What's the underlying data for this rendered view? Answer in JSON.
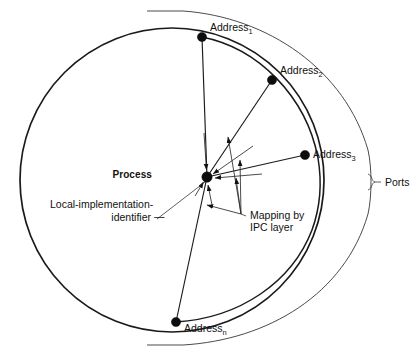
{
  "figure": {
    "background": "#ffffff",
    "ink": "#1a1a1a"
  },
  "labels": {
    "process": "Process",
    "address_base": "Address",
    "address_1_sub": "1",
    "address_2_sub": "2",
    "address_3_sub": "3",
    "address_n_sub": "n",
    "ports": "Ports",
    "local_id_line1": "Local-implementation-",
    "local_id_line2": "identifier",
    "local_id_dash": "—",
    "mapping_line1": "Mapping by",
    "mapping_line2": "IPC layer"
  },
  "nodes": [
    {
      "name": "process",
      "label": "Process",
      "x": 207,
      "y": 177,
      "r": 5.2
    },
    {
      "name": "address-1",
      "label": "Address",
      "subscript": "1",
      "x": 202,
      "y": 37,
      "r": 4.6
    },
    {
      "name": "address-2",
      "label": "Address",
      "subscript": "2",
      "x": 272,
      "y": 80,
      "r": 4.6
    },
    {
      "name": "address-3",
      "label": "Address",
      "subscript": "3",
      "x": 305,
      "y": 155,
      "r": 4.6
    },
    {
      "name": "address-n",
      "label": "Address",
      "subscript": "n",
      "x": 176,
      "y": 322,
      "r": 4.6
    }
  ],
  "geometry": {
    "main_circle": {
      "cx": 172,
      "cy": 180,
      "r": 152
    },
    "inner_arc_note": "second circle offset to the right passing through the address nodes",
    "ports_arc_note": "outer open brace arc labelled Ports"
  },
  "annotations": [
    {
      "name": "local-implementation-identifier",
      "text": "Local-implementation-identifier",
      "leader_from": {
        "x": 186,
        "y": 213
      },
      "leader_to": {
        "x": 205,
        "y": 183
      }
    },
    {
      "name": "mapping-by-ipc-layer",
      "text": "Mapping by IPC layer",
      "leader_from": {
        "x": 241,
        "y": 214
      }
    },
    {
      "name": "ports",
      "text": "Ports",
      "brace_at": {
        "x": 372,
        "y": 182
      }
    }
  ]
}
